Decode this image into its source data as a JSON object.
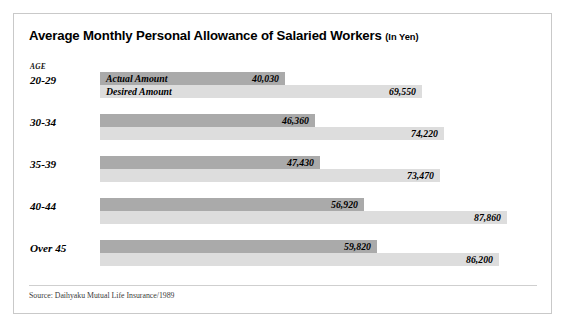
{
  "chart_data": {
    "type": "bar",
    "orientation": "horizontal",
    "title": "Average Monthly Personal Allowance of Salaried Workers",
    "title_unit": "(In Yen)",
    "xlabel": "",
    "ylabel": "AGE",
    "grid": false,
    "legend_position": "inside-first-group",
    "categories": [
      "20-29",
      "30-34",
      "35-39",
      "40-44",
      "Over 45"
    ],
    "series": [
      {
        "name": "Actual Amount",
        "color": "#aaaaaa",
        "values": [
          40030,
          46360,
          47430,
          56920,
          59820
        ],
        "value_labels": [
          "40,030",
          "46,360",
          "47,430",
          "56,920",
          "59,820"
        ]
      },
      {
        "name": "Desired Amount",
        "color": "#dddddd",
        "values": [
          69550,
          74220,
          73470,
          87860,
          86200
        ],
        "value_labels": [
          "69,550",
          "74,220",
          "73,470",
          "87,860",
          "86,200"
        ]
      }
    ],
    "xlim": [
      0,
      92000
    ],
    "source": "Source: Daihyaku Mutual Life Insurance/1989"
  },
  "card": {
    "border_color": "#c9c9c9",
    "background": "#ffffff"
  }
}
